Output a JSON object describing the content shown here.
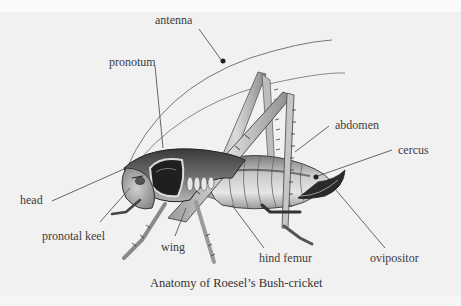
{
  "figure": {
    "caption": "Anatomy of Roesel’s Bush-cricket",
    "labels": [
      {
        "id": "antenna",
        "text": "antenna",
        "x": 155,
        "y": 20
      },
      {
        "id": "pronotum",
        "text": "pronotum",
        "x": 109,
        "y": 55
      },
      {
        "id": "abdomen",
        "text": "abdomen",
        "x": 335,
        "y": 120
      },
      {
        "id": "cercus",
        "text": "cercus",
        "x": 398,
        "y": 143
      },
      {
        "id": "head",
        "text": "head",
        "x": 20,
        "y": 193
      },
      {
        "id": "pronotal-keel",
        "text": "pronotal keel",
        "x": 42,
        "y": 229
      },
      {
        "id": "wing",
        "text": "wing",
        "x": 161,
        "y": 240
      },
      {
        "id": "hind-femur",
        "text": "hind femur",
        "x": 259,
        "y": 252
      },
      {
        "id": "ovipositor",
        "text": "ovipositor",
        "x": 370,
        "y": 252
      }
    ],
    "colors": {
      "background": "#f1f1f1",
      "label_text": "#3c3c3c",
      "leader_line": "#555555",
      "insect_dark": "#2b2b2b",
      "insect_mid": "#8a8a8a",
      "insect_light": "#d8d8d8"
    }
  }
}
